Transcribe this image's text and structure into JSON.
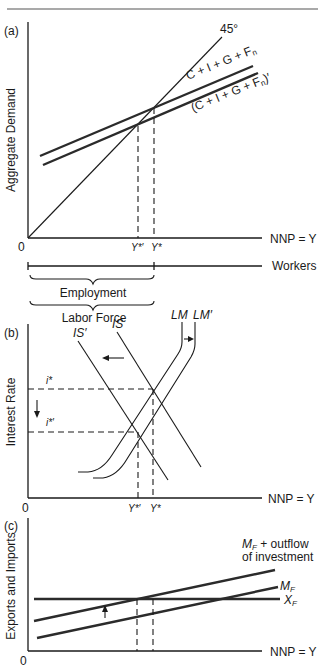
{
  "panel_a": {
    "label": "(a)",
    "y_axis_label": "Aggregate Demand",
    "x_axis_label": "NNP = Y",
    "origin_label": "0",
    "line_45_label": "45°",
    "ad_label": "C + I + G + F",
    "ad_sub": "n",
    "ad_prime_label_open": "(C + I + G + F",
    "ad_prime_sub": "n",
    "ad_prime_label_close": ")′",
    "y_star_prime": "Y*′",
    "y_star": "Y*",
    "workers_label": "Workers",
    "employment_label": "Employment",
    "labor_force_label": "Labor Force"
  },
  "panel_b": {
    "label": "(b)",
    "y_axis_label": "Interest Rate",
    "x_axis_label": "NNP = Y",
    "origin_label": "0",
    "is_label": "IS",
    "is_prime_label": "IS′",
    "lm_label": "LM",
    "lm_prime_label": "LM′",
    "i_star": "i*",
    "i_star_prime": "i*′",
    "y_star_prime": "Y*′",
    "y_star": "Y*"
  },
  "panel_c": {
    "label": "(c)",
    "y_axis_label": "Exports and Imports",
    "x_axis_label": "NNP = Y",
    "origin_label": "0",
    "mf_outflow_label_1": "M",
    "mf_outflow_sub": "F",
    "mf_outflow_label_2": " + outflow",
    "mf_outflow_label_3": "of investment",
    "mf_label": "M",
    "mf_sub": "F",
    "xf_label": "X",
    "xf_sub": "F"
  }
}
